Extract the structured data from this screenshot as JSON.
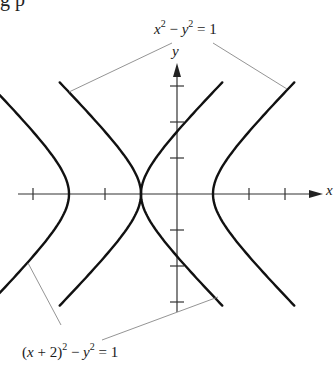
{
  "diagram": {
    "top_cut_text": "g  p",
    "axes": {
      "x_label": "x",
      "y_label": "y",
      "origin_px": [
        177,
        194
      ],
      "unit_px": 36,
      "x_ticks": [
        -4,
        -2,
        2,
        3
      ],
      "y_ticks": [
        -3,
        -2,
        -1,
        1,
        2,
        3
      ]
    },
    "curves": [
      {
        "id": "hyperbola-1",
        "equation_parts": {
          "a": "x",
          "b": "2",
          "c": " − ",
          "d": "y",
          "e": "2",
          "f": " = 1"
        },
        "center": [
          0,
          0
        ]
      },
      {
        "id": "hyperbola-2",
        "equation_parts": {
          "a": "(",
          "b": "x",
          "c": " + 2)",
          "d": "2",
          "e": " − ",
          "f": "y",
          "g": "2",
          "h": " = 1"
        },
        "center": [
          -2,
          0
        ]
      }
    ],
    "colors": {
      "curve": "#111111",
      "axis": "#333333",
      "leader": "#888888"
    }
  }
}
